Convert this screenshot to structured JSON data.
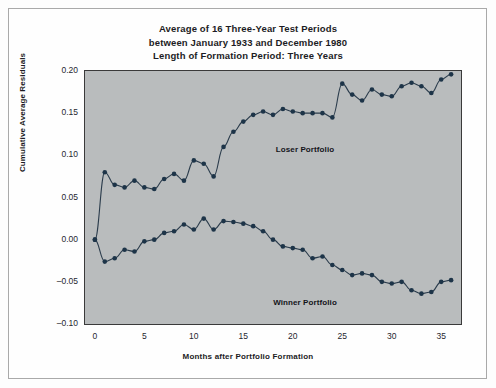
{
  "figure": {
    "title_lines": [
      "Average of 16 Three-Year Test Periods",
      "between January 1933 and December 1980",
      "Length of Formation Period: Three Years"
    ]
  },
  "chart_data": {
    "type": "line",
    "xlabel": "Months after Portfolio Formation",
    "ylabel": "Cumulative Average Residuals",
    "xlim": [
      -1,
      37
    ],
    "ylim": [
      -0.1,
      0.2
    ],
    "xticks": [
      0,
      5,
      10,
      15,
      20,
      25,
      30,
      35
    ],
    "xtick_labels": [
      "0",
      "5",
      "10",
      "15",
      "20",
      "25",
      "30",
      "35"
    ],
    "yticks": [
      -0.1,
      -0.05,
      0.0,
      0.05,
      0.1,
      0.15,
      0.2
    ],
    "ytick_labels": [
      "-0.10",
      "-0.05",
      "0.00",
      "0.05",
      "0.10",
      "0.15",
      "0.20"
    ],
    "grid": false,
    "legend": "inline-annotations",
    "marker": "filled-circle",
    "marker_color": "#1d3448",
    "line_color": "#2b3c4c",
    "plot_background": "#b9bcbd",
    "x": [
      0,
      1,
      2,
      3,
      4,
      5,
      6,
      7,
      8,
      9,
      10,
      11,
      12,
      13,
      14,
      15,
      16,
      17,
      18,
      19,
      20,
      21,
      22,
      23,
      24,
      25,
      26,
      27,
      28,
      29,
      30,
      31,
      32,
      33,
      34,
      35,
      36
    ],
    "series": [
      {
        "name": "Loser Portfolio",
        "label_x": 21,
        "label_y": 0.102,
        "values": [
          0.0,
          0.08,
          0.065,
          0.062,
          0.07,
          0.062,
          0.06,
          0.072,
          0.078,
          0.07,
          0.094,
          0.09,
          0.075,
          0.11,
          0.128,
          0.14,
          0.148,
          0.152,
          0.148,
          0.155,
          0.152,
          0.15,
          0.15,
          0.15,
          0.145,
          0.185,
          0.172,
          0.165,
          0.178,
          0.172,
          0.17,
          0.182,
          0.186,
          0.182,
          0.174,
          0.19,
          0.196
        ]
      },
      {
        "name": "Winner Portfolio",
        "label_x": 21,
        "label_y": -0.092,
        "values": [
          0.0,
          -0.026,
          -0.022,
          -0.012,
          -0.014,
          -0.002,
          0.0,
          0.008,
          0.01,
          0.018,
          0.012,
          0.025,
          0.012,
          0.022,
          0.021,
          0.019,
          0.016,
          0.01,
          0.0,
          -0.008,
          -0.01,
          -0.012,
          -0.022,
          -0.02,
          -0.03,
          -0.036,
          -0.042,
          -0.04,
          -0.042,
          -0.05,
          -0.052,
          -0.05,
          -0.06,
          -0.064,
          -0.062,
          -0.05,
          -0.048
        ]
      }
    ]
  },
  "axis": {
    "ylabel_text": "Cumulative Average Residuals",
    "xlabel_text": "Months after Portfolio Formation"
  }
}
